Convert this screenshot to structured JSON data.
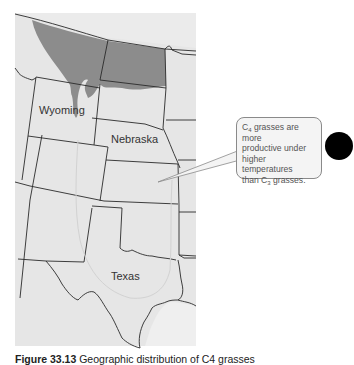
{
  "map": {
    "states": [
      {
        "name": "Wyoming",
        "label": "Wyoming"
      },
      {
        "name": "Nebraska",
        "label": "Nebraska"
      },
      {
        "name": "Texas",
        "label": "Texas"
      }
    ],
    "shaded_region_color": "#8c8c8c",
    "land_color": "#e6e6e6",
    "border_color": "#2a2a2a"
  },
  "callout": {
    "line1_prefix": "C",
    "line1_sub": "4",
    "line1_suffix": " grasses are more",
    "line2": "productive under",
    "line3": "higher temperatures",
    "line4_prefix": "than C",
    "line4_sub": "3",
    "line4_suffix": " grasses."
  },
  "marker": {
    "color": "#000000"
  },
  "caption": {
    "label": "Figure 33.13",
    "text": " Geographic distribution of C4 grasses"
  }
}
